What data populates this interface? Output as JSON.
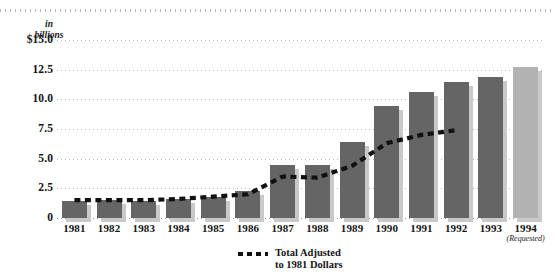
{
  "chart_data": {
    "type": "bar",
    "title": "",
    "subtitle": "",
    "units_label_line1": "in",
    "units_label_line2": "billions",
    "xlabel": "",
    "ylabel": "in billions",
    "ylim": [
      0,
      15.0
    ],
    "yticks": [
      "$15.0",
      "12.5",
      "10.0",
      "7.5",
      "5.0",
      "2.5",
      "0"
    ],
    "ytick_values": [
      15.0,
      12.5,
      10.0,
      7.5,
      5.0,
      2.5,
      0
    ],
    "grid": true,
    "legend_position": "bottom-center",
    "categories": [
      "1981",
      "1982",
      "1983",
      "1984",
      "1985",
      "1986",
      "1987",
      "1988",
      "1989",
      "1990",
      "1991",
      "1992",
      "1993",
      "1994"
    ],
    "category_annotations": [
      "",
      "",
      "",
      "",
      "",
      "",
      "",
      "",
      "",
      "",
      "",
      "",
      "",
      "(Requested)"
    ],
    "series": [
      {
        "name": "Total",
        "kind": "bar",
        "values": [
          1.4,
          1.5,
          1.4,
          1.6,
          1.8,
          2.3,
          4.5,
          4.5,
          6.4,
          9.4,
          10.6,
          11.5,
          11.9,
          12.7
        ],
        "colors": [
          "#656565",
          "#656565",
          "#656565",
          "#656565",
          "#656565",
          "#656565",
          "#656565",
          "#656565",
          "#656565",
          "#656565",
          "#656565",
          "#656565",
          "#656565",
          "#b2b2b2"
        ]
      },
      {
        "name": "Total Adjusted to 1981 Dollars",
        "kind": "line-dashed",
        "color": "#111111",
        "values": [
          1.5,
          1.5,
          1.5,
          1.6,
          1.8,
          2.0,
          3.5,
          3.4,
          4.4,
          6.3,
          7.0,
          7.4,
          null,
          null
        ]
      }
    ],
    "legend": [
      {
        "marker": "dashed-line",
        "label_line1": "Total Adjusted",
        "label_line2": "to 1981 Dollars"
      }
    ]
  }
}
